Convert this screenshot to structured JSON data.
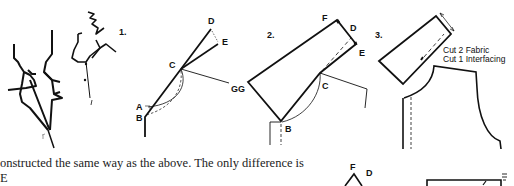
{
  "figures": [
    {
      "step": "1.",
      "labels": [
        "A",
        "B",
        "C",
        "D",
        "E",
        "G"
      ]
    },
    {
      "step": "2.",
      "labels": [
        "F",
        "D",
        "E",
        "C",
        "B",
        "G"
      ]
    },
    {
      "step": "3.",
      "notes": [
        "Cut 2 Fabric",
        "Cut 1 Interfacing"
      ]
    }
  ],
  "bottom_figure": {
    "labels": [
      "F",
      "D"
    ]
  },
  "paragraph": {
    "lines": [
      "onstructed the same way as the above. The only difference is",
      "E"
    ]
  },
  "colors": {
    "ink": "#111111",
    "background": "#ffffff"
  }
}
